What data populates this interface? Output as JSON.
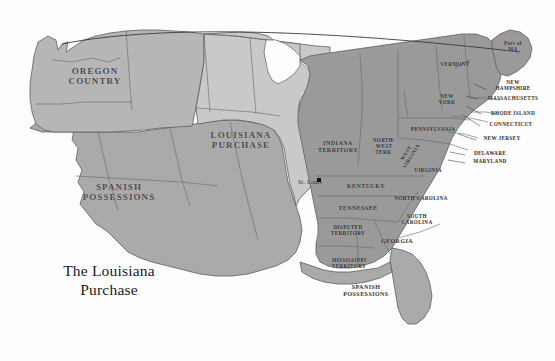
{
  "map": {
    "title_line1": "The Louisiana",
    "title_line2": "Purchase",
    "canvas": {
      "width": 555,
      "height": 361
    },
    "background_color": "#fdfdfd",
    "border_color": "#5e5e5e"
  },
  "palette": {
    "oregon_country": "#b6b6b6",
    "louisiana_purchase": "#c9c9c9",
    "spanish_possessions": "#aaaaaa",
    "eastern_states": "#9a9a9a",
    "great_lakes": "#fdfdfd",
    "outline": "#5e5e5e",
    "label_dark": "#333333",
    "label_region": "#4a4a4a",
    "city_marker": "#111111"
  },
  "regions": [
    {
      "id": "oregon-country",
      "label": "OREGON\nCOUNTRY",
      "shade": "oregon_country",
      "x": 95,
      "y": 74
    },
    {
      "id": "louisiana-purchase",
      "label": "LOUISIANA\nPURCHASE",
      "shade": "louisiana_purchase",
      "x": 240,
      "y": 138
    },
    {
      "id": "spanish-possessions-west",
      "label": "SPANISH\nPOSSESSIONS",
      "shade": "spanish_possessions",
      "x": 118,
      "y": 190
    },
    {
      "id": "spanish-possessions-florida",
      "label": "SPANISH\nPOSSESSIONS",
      "shade": "spanish_possessions",
      "x": 366,
      "y": 291
    }
  ],
  "territories": [
    {
      "id": "indiana-territory",
      "label": "INDIANA\nTERRITORY",
      "x": 338,
      "y": 147
    },
    {
      "id": "north-west-territory",
      "label": "NORTH-\nWEST\nTERR.",
      "x": 383,
      "y": 148
    },
    {
      "id": "disputed-territory",
      "label": "DISPUTED\nTERRITORY",
      "x": 347,
      "y": 231
    },
    {
      "id": "mississippi-territory",
      "label": "MISSISSIPPI\nTERRITORY",
      "x": 348,
      "y": 264
    }
  ],
  "states": [
    {
      "id": "kentucky",
      "label": "KENTUCKY",
      "x": 365,
      "y": 186
    },
    {
      "id": "tennessee",
      "label": "TENNESSEE",
      "x": 357,
      "y": 208
    },
    {
      "id": "georgia",
      "label": "GEORGIA",
      "x": 397,
      "y": 241
    },
    {
      "id": "south-carolina",
      "label": "SOUTH\nCAROLINA",
      "x": 416,
      "y": 220
    },
    {
      "id": "north-carolina",
      "label": "NORTH CAROLINA",
      "x": 420,
      "y": 199
    },
    {
      "id": "virginia",
      "label": "VIRGINIA",
      "x": 428,
      "y": 171
    },
    {
      "id": "west-virginia",
      "label": "WEST\nVIRGINIA",
      "x": 409,
      "y": 156
    },
    {
      "id": "pennsylvania",
      "label": "PENNSYLVANIA",
      "x": 432,
      "y": 130
    },
    {
      "id": "new-york",
      "label": "NEW\nYORK",
      "x": 447,
      "y": 100
    },
    {
      "id": "vermont",
      "label": "VERMONT",
      "x": 455,
      "y": 65
    },
    {
      "id": "part-of-ma",
      "label": "Part of\nMA",
      "x": 513,
      "y": 46
    },
    {
      "id": "new-hampshire",
      "label": "NEW\nHAMPSHIRE",
      "x": 513,
      "y": 86
    },
    {
      "id": "massachusetts",
      "label": "MASSACHUSETTS",
      "x": 512,
      "y": 99
    },
    {
      "id": "rhode-island",
      "label": "RHODE ISLAND",
      "x": 512,
      "y": 114
    },
    {
      "id": "connecticut",
      "label": "CONNECTICUT",
      "x": 511,
      "y": 125
    },
    {
      "id": "new-jersey",
      "label": "NEW JERSEY",
      "x": 501,
      "y": 139
    },
    {
      "id": "delaware",
      "label": "DELAWARE",
      "x": 489,
      "y": 154
    },
    {
      "id": "maryland",
      "label": "MARYLAND",
      "x": 489,
      "y": 162
    }
  ],
  "cities": [
    {
      "id": "st-louis",
      "label": "St. Louis",
      "x": 310,
      "y": 182,
      "dot_x": 317,
      "dot_y": 178
    }
  ]
}
